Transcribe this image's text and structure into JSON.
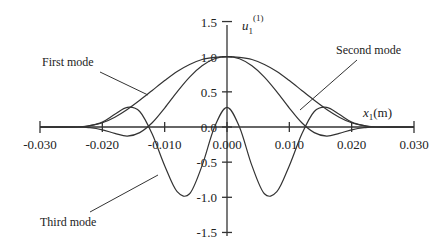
{
  "chart_data": {
    "type": "line",
    "title": "",
    "xlabel": "x 1(m)",
    "ylabel": "u 1(1)",
    "xlim": [
      -0.03,
      0.03
    ],
    "ylim": [
      -1.5,
      1.5
    ],
    "grid": false,
    "x_ticks": [
      "-0.030",
      "-0.020",
      "-0.010",
      "0.000",
      "0.010",
      "0.020",
      "0.030"
    ],
    "y_ticks": [
      "1.5",
      "1.0",
      "0.5",
      "0.0",
      "-0.5",
      "-1.0",
      "-1.5"
    ],
    "x": [
      -0.024,
      -0.022,
      -0.02,
      -0.018,
      -0.016,
      -0.014,
      -0.012,
      -0.01,
      -0.008,
      -0.006,
      -0.004,
      -0.002,
      0.0,
      0.002,
      0.004,
      0.006,
      0.008,
      0.01,
      0.012,
      0.014,
      0.016,
      0.018,
      0.02,
      0.022,
      0.024
    ],
    "series": [
      {
        "name": "First mode",
        "values": [
          0.0,
          0.02,
          0.06,
          0.14,
          0.25,
          0.38,
          0.52,
          0.66,
          0.79,
          0.89,
          0.96,
          0.99,
          1.0,
          0.99,
          0.96,
          0.89,
          0.79,
          0.66,
          0.52,
          0.38,
          0.25,
          0.14,
          0.06,
          0.02,
          0.0
        ]
      },
      {
        "name": "Second mode",
        "values": [
          0.0,
          -0.01,
          -0.04,
          -0.09,
          -0.13,
          -0.08,
          0.06,
          0.27,
          0.5,
          0.71,
          0.87,
          0.97,
          1.0,
          0.97,
          0.87,
          0.71,
          0.5,
          0.27,
          0.06,
          -0.08,
          -0.13,
          -0.09,
          -0.04,
          -0.01,
          0.0
        ]
      },
      {
        "name": "Third mode",
        "values": [
          0.0,
          0.02,
          0.07,
          0.18,
          0.28,
          0.22,
          -0.1,
          -0.55,
          -0.92,
          -0.95,
          -0.55,
          0.0,
          0.28,
          0.0,
          -0.55,
          -0.95,
          -0.92,
          -0.55,
          -0.1,
          0.22,
          0.28,
          0.18,
          0.07,
          0.02,
          0.0
        ]
      }
    ],
    "annotations": [
      "First mode",
      "Second mode",
      "Third mode"
    ]
  },
  "labels": {
    "y_axis_main": "u",
    "y_axis_sub": "1",
    "y_axis_sup": "(1)",
    "x_axis_main": "x",
    "x_axis_sub": "1",
    "x_axis_unit": "(m)",
    "first_mode": "First mode",
    "second_mode": "Second mode",
    "third_mode": "Third mode"
  }
}
